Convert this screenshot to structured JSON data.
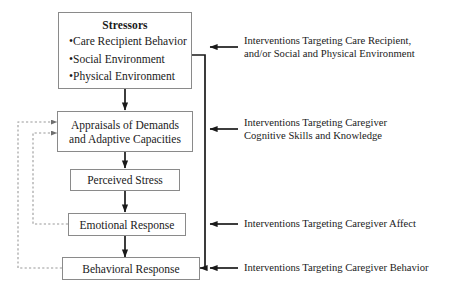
{
  "diagram": {
    "background_color": "#ffffff",
    "box_border_color": "#8a8a8a",
    "line_color": "#1a1a1a",
    "dashed_line_color": "#9a9a9a"
  },
  "boxes": {
    "stressors": {
      "title": "Stressors",
      "bullets": [
        "Care Recipient Behavior",
        "Social Environment",
        "Physical Environment"
      ],
      "bullet_marker": "•"
    },
    "appraisals": {
      "line1": "Appraisals of Demands",
      "line2": "and Adaptive Capacities"
    },
    "perceived_stress": {
      "label": "Perceived Stress"
    },
    "emotional_response": {
      "label": "Emotional Response"
    },
    "behavioral_response": {
      "label": "Behavioral Response"
    }
  },
  "annotations": [
    {
      "id": "intervention-stressors",
      "line1": "Interventions Targeting Care Recipient,",
      "line2": "and/or Social and Physical Environment"
    },
    {
      "id": "intervention-appraisals",
      "line1": "Interventions Targeting Caregiver",
      "line2": "Cognitive Skills and Knowledge"
    },
    {
      "id": "intervention-emotional",
      "line1": "Interventions Targeting Caregiver Affect",
      "line2": ""
    },
    {
      "id": "intervention-behavioral",
      "line1": "Interventions Targeting Caregiver Behavior",
      "line2": ""
    }
  ]
}
